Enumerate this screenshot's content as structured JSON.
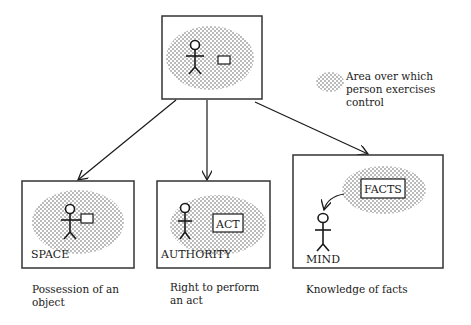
{
  "legend": {
    "symbol": "stipple-area",
    "text": "Area over which\nperson exercises\ncontrol"
  },
  "top_box": {
    "figure": "stick-person",
    "object": "small-rectangle-object"
  },
  "boxes": [
    {
      "label": "SPACE",
      "inner": "object",
      "caption": "Possession of an\nobject"
    },
    {
      "label": "AUTHORITY",
      "inner": "ACT",
      "caption": "Right to perform\nan act"
    },
    {
      "label": "MIND",
      "inner": "FACTS",
      "caption": "Knowledge of facts"
    }
  ],
  "colors": {
    "ink": "#1a1a1a",
    "stipple": "#6a6a6a",
    "background": "#ffffff"
  }
}
